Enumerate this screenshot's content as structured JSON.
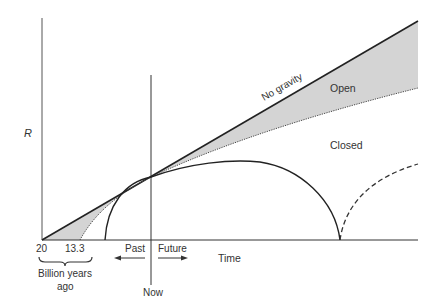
{
  "diagram": {
    "y_axis_label": "R",
    "x_axis_label": "Time",
    "curves": {
      "no_gravity": "No gravity",
      "open": "Open",
      "closed": "Closed"
    },
    "ticks": {
      "t20": "20",
      "t13": "13.3"
    },
    "brace_label_line1": "Billion years",
    "brace_label_line2": "ago",
    "now_label": "Now",
    "past_label": "Past",
    "future_label": "Future",
    "colors": {
      "line": "#222222",
      "shade": "#d4d4d4",
      "axis": "#555555"
    }
  }
}
